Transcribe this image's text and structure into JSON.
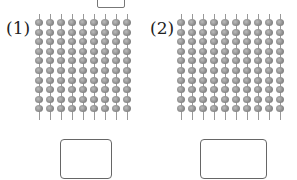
{
  "problems": [
    {
      "label": "(1)",
      "columns": 9,
      "beads_per_column": 10,
      "answer": ""
    },
    {
      "label": "(2)",
      "columns": 10,
      "beads_per_column": 10,
      "answer": ""
    }
  ],
  "colors": {
    "bead": "#8a8a8a",
    "rod": "#999999",
    "box_border": "#666666"
  }
}
